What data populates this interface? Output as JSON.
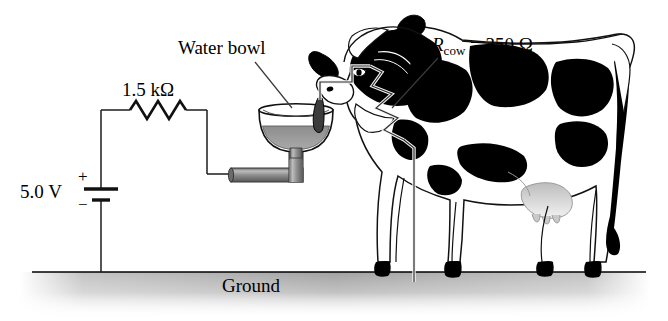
{
  "figure": {
    "width": 668,
    "height": 321,
    "background_color": "#ffffff"
  },
  "labels": {
    "water_bowl": "Water bowl",
    "resistor_value": "1.5 kΩ",
    "voltage": "5.0 V",
    "battery_plus": "+",
    "battery_minus": "−",
    "rcow_symbol": "R",
    "rcow_subscript": "cow",
    "rcow_value": " = 350 Ω",
    "ground": "Ground"
  },
  "circuit": {
    "source_voltage": "5.0 V",
    "series_resistor": "1.5 kΩ",
    "cow_resistance": "350 Ω",
    "elements": [
      "battery",
      "resistor-1.5k",
      "water-pipe",
      "water-bowl",
      "cow-body-resistance",
      "ground"
    ]
  },
  "colors": {
    "ink": "#000000",
    "wire": "#1a1a1a",
    "pipe_fill": "#8c8c8c",
    "pipe_edge": "#3d3d3d",
    "water_fill": "#9a9a9a",
    "ground_shade": "#a8a8a8",
    "cow_white": "#ffffff",
    "cow_black": "#000000",
    "udder_shade": "#c8c8c8"
  },
  "icons": {
    "battery": "battery-symbol",
    "resistor": "resistor-zigzag-icon",
    "ground": "ground-line-icon"
  }
}
